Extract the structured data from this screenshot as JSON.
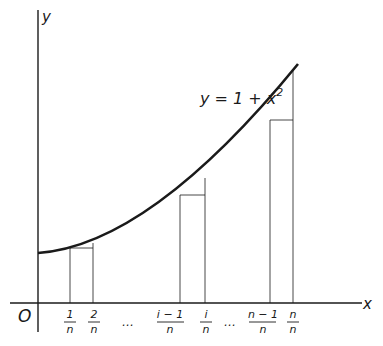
{
  "diagram": {
    "type": "riemann-sum-illustration",
    "curve_label": {
      "lhs": "y = 1 + x",
      "exponent": "2"
    },
    "axes": {
      "x_label": "x",
      "y_label": "y",
      "origin_label": "O"
    },
    "ticks": [
      {
        "num": "1",
        "den": "n"
      },
      {
        "num": "2",
        "den": "n"
      },
      {
        "num": "…",
        "den": ""
      },
      {
        "num": "i − 1",
        "den": "n"
      },
      {
        "num": "i",
        "den": "n"
      },
      {
        "num": "…",
        "den": ""
      },
      {
        "num": "n − 1",
        "den": "n"
      },
      {
        "num": "n",
        "den": "n"
      }
    ],
    "rectangles": [
      {
        "from": "1/n",
        "to": "2/n"
      },
      {
        "from": "(i−1)/n",
        "to": "i/n"
      },
      {
        "from": "(n−1)/n",
        "to": "n/n"
      }
    ],
    "colors": {
      "ink": "#1a1a1a",
      "background": "#ffffff"
    }
  }
}
